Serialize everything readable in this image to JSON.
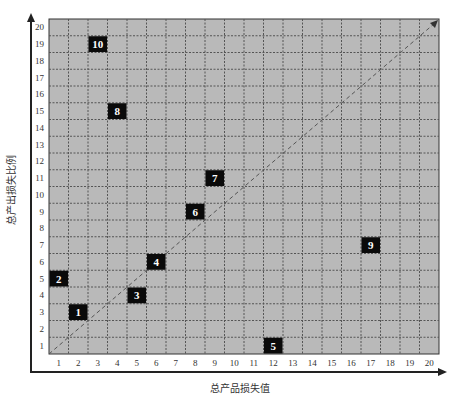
{
  "chart_data": {
    "type": "scatter",
    "title": "",
    "xlabel": "总产品损失值",
    "ylabel": "总产出损失比例",
    "xlim": [
      0,
      20
    ],
    "ylim": [
      0,
      20
    ],
    "x_ticks": [
      1,
      2,
      3,
      4,
      5,
      6,
      7,
      8,
      9,
      10,
      11,
      12,
      13,
      14,
      15,
      16,
      17,
      18,
      19,
      20
    ],
    "y_ticks": [
      1,
      2,
      3,
      4,
      5,
      6,
      7,
      8,
      9,
      10,
      11,
      12,
      13,
      14,
      15,
      16,
      17,
      18,
      19,
      20
    ],
    "grid": true,
    "grid_style": "dotted",
    "diagonal_reference_line": {
      "from": [
        0,
        0
      ],
      "to": [
        20,
        20
      ],
      "style": "dashed"
    },
    "points": [
      {
        "label": "1",
        "x": 2,
        "y": 3
      },
      {
        "label": "2",
        "x": 1,
        "y": 5
      },
      {
        "label": "3",
        "x": 5,
        "y": 4
      },
      {
        "label": "4",
        "x": 6,
        "y": 6
      },
      {
        "label": "5",
        "x": 12,
        "y": 1
      },
      {
        "label": "6",
        "x": 8,
        "y": 9
      },
      {
        "label": "7",
        "x": 9,
        "y": 11
      },
      {
        "label": "8",
        "x": 4,
        "y": 15
      },
      {
        "label": "9",
        "x": 17,
        "y": 7
      },
      {
        "label": "10",
        "x": 3,
        "y": 19
      }
    ],
    "colors": {
      "plot_background": "#b9b9b9",
      "grid": "#555555",
      "marker_fill": "#0a0a0a",
      "marker_text": "#ffffff",
      "axis": "#222222"
    }
  }
}
